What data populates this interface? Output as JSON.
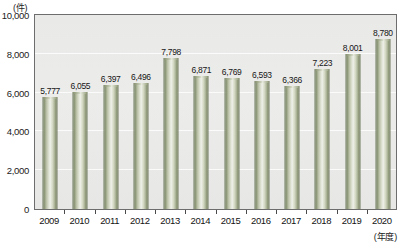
{
  "chart_data": {
    "type": "bar",
    "title": "",
    "subtitle": "",
    "xlabel": "(年度)",
    "ylabel": "(件)",
    "categories": [
      "2009",
      "2010",
      "2011",
      "2012",
      "2013",
      "2014",
      "2015",
      "2016",
      "2017",
      "2018",
      "2019",
      "2020"
    ],
    "values": [
      5777,
      6055,
      6397,
      6496,
      7798,
      6871,
      6769,
      6593,
      6366,
      7223,
      8001,
      8780
    ],
    "data_labels": [
      "5,777",
      "6,055",
      "6,397",
      "6,496",
      "7,798",
      "6,871",
      "6,769",
      "6,593",
      "6,366",
      "7,223",
      "8,001",
      "8,780"
    ],
    "ylim": [
      0,
      10000
    ],
    "ytick_values": [
      0,
      2000,
      4000,
      6000,
      8000,
      10000
    ],
    "ytick_labels": [
      "0",
      "2,000",
      "4,000",
      "6,000",
      "8,000",
      "10,000"
    ],
    "grid": true,
    "grid_axis": "y",
    "legend": false,
    "legend_position": "none",
    "series": [
      {
        "name": "件数",
        "values": [
          5777,
          6055,
          6397,
          6496,
          7798,
          6871,
          6769,
          6593,
          6366,
          7223,
          8001,
          8780
        ]
      }
    ],
    "colors": {
      "bar_light": "#eef0e8",
      "bar_mid": "#b9c0a6",
      "bar_dark": "#76815f",
      "plot_background": "#ebebe9",
      "frame": "#6d6d6d",
      "gridline": "#fbfbfb",
      "text": "#151515"
    }
  }
}
